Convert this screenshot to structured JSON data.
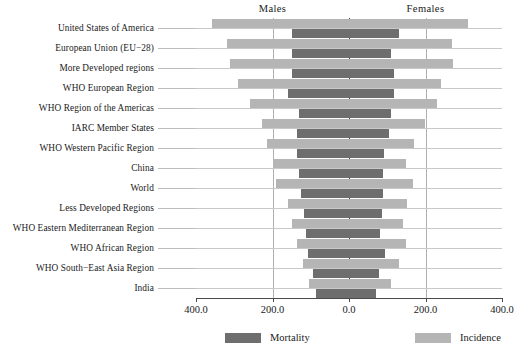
{
  "chart_data": {
    "type": "bar",
    "subtype": "diverging-population-pyramid",
    "title": "",
    "xlabel": "",
    "ylabel": "",
    "xlim": [
      -400.0,
      400.0
    ],
    "grid": true,
    "legend_position": "bottom",
    "group_headers": [
      {
        "label": "Males",
        "side": "left"
      },
      {
        "label": "Females",
        "side": "right"
      }
    ],
    "xticks": [
      {
        "value": -400.0,
        "label": "400.0"
      },
      {
        "value": -200.0,
        "label": "200.0"
      },
      {
        "value": 0.0,
        "label": "0.0"
      },
      {
        "value": 200.0,
        "label": "200.0"
      },
      {
        "value": 400.0,
        "label": "400.0"
      }
    ],
    "legend": [
      {
        "name": "Mortality",
        "color": "#6e6e6e"
      },
      {
        "name": "Incidence",
        "color": "#b5b5b5"
      }
    ],
    "categories": [
      "United States of America",
      "European Union (EU−28)",
      "More Developed regions",
      "WHO European Region",
      "WHO Region of the Americas",
      "IARC Member States",
      "WHO Western Pacific Region",
      "China",
      "World",
      "Less Developed Regions",
      "WHO Eastern Mediterranean Region",
      "WHO African Region",
      "WHO South−East Asia Region",
      "India"
    ],
    "series": [
      {
        "name": "Incidence",
        "color": "#b5b5b5",
        "males": [
          358,
          318,
          310,
          290,
          260,
          228,
          215,
          200,
          190,
          160,
          150,
          135,
          120,
          105
        ],
        "females": [
          311,
          268,
          272,
          240,
          230,
          198,
          170,
          150,
          168,
          152,
          140,
          150,
          132,
          110
        ]
      },
      {
        "name": "Mortality",
        "color": "#6e6e6e",
        "males": [
          148,
          150,
          150,
          160,
          130,
          135,
          135,
          130,
          125,
          118,
          112,
          108,
          95,
          85
        ],
        "females": [
          130,
          110,
          118,
          118,
          110,
          105,
          92,
          88,
          88,
          85,
          82,
          95,
          78,
          70
        ]
      }
    ]
  }
}
